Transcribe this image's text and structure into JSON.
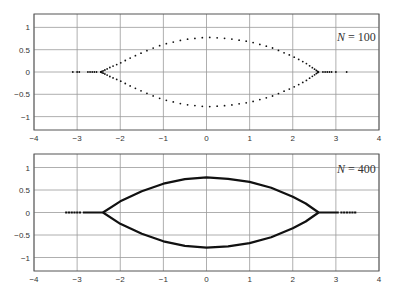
{
  "chart_data": [
    {
      "type": "scatter",
      "title": "",
      "annotation": "N = 100",
      "annotation_n": "N",
      "annotation_rest": " = 100",
      "xlabel": "",
      "ylabel": "",
      "xlim": [
        -4,
        4
      ],
      "ylim": [
        -1.3,
        1.3
      ],
      "xticks": [
        "−4",
        "−3",
        "−2",
        "−1",
        "0",
        "1",
        "2",
        "3",
        "4"
      ],
      "yticks": [
        "1",
        "0.5",
        "0",
        "−0.5",
        "−1"
      ],
      "grid": true,
      "marker": "dots",
      "series": [
        {
          "name": "upper branch",
          "x": [
            -2.45,
            -2.2,
            -2.0,
            -1.8,
            -1.5,
            -1.2,
            -1.0,
            -0.5,
            0.0,
            0.5,
            1.0,
            1.5,
            2.0,
            2.3,
            2.6
          ],
          "y": [
            0.0,
            0.12,
            0.2,
            0.3,
            0.43,
            0.55,
            0.62,
            0.73,
            0.78,
            0.75,
            0.68,
            0.55,
            0.35,
            0.2,
            0.0
          ]
        },
        {
          "name": "lower branch",
          "x": [
            -2.45,
            -2.2,
            -2.0,
            -1.8,
            -1.5,
            -1.2,
            -1.0,
            -0.5,
            0.0,
            0.5,
            1.0,
            1.5,
            2.0,
            2.3,
            2.6
          ],
          "y": [
            0.0,
            -0.12,
            -0.2,
            -0.3,
            -0.43,
            -0.55,
            -0.62,
            -0.73,
            -0.78,
            -0.75,
            -0.68,
            -0.55,
            -0.35,
            -0.2,
            0.0
          ]
        },
        {
          "name": "real axis tails",
          "x": [
            -3.1,
            -3.0,
            -2.95,
            -2.75,
            -2.7,
            -2.65,
            -2.6,
            -2.55,
            2.7,
            2.75,
            2.8,
            2.85,
            2.9,
            3.0,
            3.25
          ],
          "y": [
            0,
            0,
            0,
            0,
            0,
            0,
            0,
            0,
            0,
            0,
            0,
            0,
            0,
            0,
            0
          ]
        }
      ]
    },
    {
      "type": "scatter",
      "title": "",
      "annotation": "N = 400",
      "annotation_n": "N",
      "annotation_rest": " = 400",
      "xlabel": "",
      "ylabel": "",
      "xlim": [
        -4,
        4
      ],
      "ylim": [
        -1.3,
        1.3
      ],
      "xticks": [
        "−4",
        "−3",
        "−2",
        "−1",
        "0",
        "1",
        "2",
        "3",
        "4"
      ],
      "yticks": [
        "1",
        "0.5",
        "0",
        "−0.5",
        "−1"
      ],
      "grid": true,
      "marker": "dense dots (appear as solid line)",
      "series": [
        {
          "name": "upper branch",
          "x": [
            -2.4,
            -2.0,
            -1.5,
            -1.0,
            -0.5,
            0.0,
            0.5,
            1.0,
            1.5,
            2.0,
            2.3,
            2.6
          ],
          "y": [
            0.0,
            0.25,
            0.47,
            0.64,
            0.74,
            0.78,
            0.75,
            0.68,
            0.55,
            0.35,
            0.2,
            0.0
          ]
        },
        {
          "name": "lower branch",
          "x": [
            -2.4,
            -2.0,
            -1.5,
            -1.0,
            -0.5,
            0.0,
            0.5,
            1.0,
            1.5,
            2.0,
            2.3,
            2.6
          ],
          "y": [
            0.0,
            -0.25,
            -0.47,
            -0.64,
            -0.74,
            -0.78,
            -0.75,
            -0.68,
            -0.55,
            -0.35,
            -0.2,
            0.0
          ]
        },
        {
          "name": "real axis tails",
          "x_ranges": [
            [
              -3.25,
              -2.4
            ],
            [
              2.6,
              3.45
            ]
          ],
          "y": 0
        }
      ]
    }
  ],
  "colors": {
    "data": "#111111",
    "grid": "#9a9a9a",
    "frame": "#555555",
    "text": "#333333"
  }
}
